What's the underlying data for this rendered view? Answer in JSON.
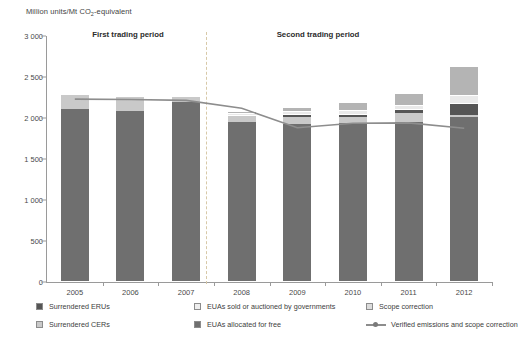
{
  "chart_data": {
    "type": "bar",
    "title": "",
    "ylabel": "Million units/Mt CO2-equivalent",
    "ylabel_main": "Million units/Mt CO",
    "ylabel_sub": "2",
    "ylabel_tail": "-equivalent",
    "xlabel": "",
    "categories": [
      "2005",
      "2006",
      "2007",
      "2008",
      "2009",
      "2010",
      "2011",
      "2012"
    ],
    "ytick_labels": [
      "0",
      "500",
      "1 000",
      "1 500",
      "2 000",
      "2 500",
      "3 000"
    ],
    "ytick_values": [
      0,
      500,
      1000,
      1500,
      2000,
      2500,
      3000
    ],
    "ylim": [
      0,
      3000
    ],
    "grid": false,
    "legend_position": "bottom",
    "stacked": true,
    "series": [
      {
        "name": "EUAs allocated for free",
        "key": "euas_free",
        "color": "#6f6f6f",
        "values": [
          2110,
          2090,
          2200,
          1950,
          1930,
          1940,
          1950,
          2010
        ]
      },
      {
        "name": "Surrendered CERs",
        "key": "cers",
        "color": "#c9c9c9",
        "values": [
          180,
          180,
          65,
          70,
          80,
          75,
          110,
          30
        ]
      },
      {
        "name": "Surrendered ERUs",
        "key": "erus",
        "color": "#555555",
        "values": [
          0,
          0,
          0,
          0,
          25,
          25,
          40,
          125
        ]
      },
      {
        "name": "EUAs sold or auctioned by governments",
        "key": "euas_sold",
        "color": "#e9e9e9",
        "values": [
          0,
          0,
          0,
          45,
          50,
          55,
          55,
          110
        ]
      },
      {
        "name": "Scope correction",
        "key": "scope",
        "color": "#b4b4b4",
        "values": [
          0,
          0,
          0,
          25,
          55,
          95,
          155,
          360
        ]
      }
    ],
    "line_series": {
      "name": "Verified emissions and scope correction",
      "color": "#8d8d8d",
      "values": [
        2230,
        2225,
        2215,
        2120,
        1880,
        1935,
        1940,
        1875
      ]
    },
    "totals": [
      2290,
      2270,
      2265,
      2090,
      2140,
      2190,
      2310,
      2635
    ],
    "annotations": [
      {
        "text": "First trading period",
        "x_center_category": "2006",
        "value": 2950
      },
      {
        "text": "Second trading period",
        "x_center_category": "2010",
        "value": 2950
      }
    ]
  },
  "axis": {
    "y_title_main": "Million units/Mt CO",
    "y_title_sub": "2",
    "y_title_tail": "-equivalent"
  },
  "annotations": {
    "first_period": "First trading period",
    "second_period": "Second trading period"
  },
  "legend": {
    "items": [
      {
        "label": "Surrendered ERUs",
        "marker": "square",
        "swatch": "erus"
      },
      {
        "label": "Surrendered CERs",
        "marker": "square",
        "swatch": "cers"
      },
      {
        "label": "EUAs sold or auctioned by governments",
        "marker": "square",
        "swatch": "euasold"
      },
      {
        "label": "EUAs allocated for free",
        "marker": "square",
        "swatch": "euafree"
      },
      {
        "label": "Scope correction",
        "marker": "square",
        "swatch": "scope"
      },
      {
        "label": "Verified emissions and scope correction",
        "marker": "line",
        "swatch": "line"
      }
    ]
  },
  "colors": {
    "erus": "#555555",
    "cers": "#c9c9c9",
    "euas_sold": "#e9e9e9",
    "euas_free": "#6f6f6f",
    "scope": "#b4b4b4",
    "line": "#8d8d8d",
    "axis": "#9a9a9a",
    "divider": "#d8c9a8"
  }
}
